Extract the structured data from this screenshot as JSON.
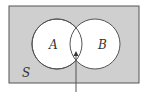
{
  "diagram": {
    "type": "venn",
    "universe_label": "S",
    "sets": [
      {
        "label": "A"
      },
      {
        "label": "B"
      }
    ],
    "highlighted_region": "A ∩ B",
    "colors": {
      "universe_fill": "#cfcfcf",
      "universe_stroke": "#555555",
      "circle_fill": "#ffffff",
      "circle_stroke": "#555555",
      "arrow": "#333333"
    }
  }
}
